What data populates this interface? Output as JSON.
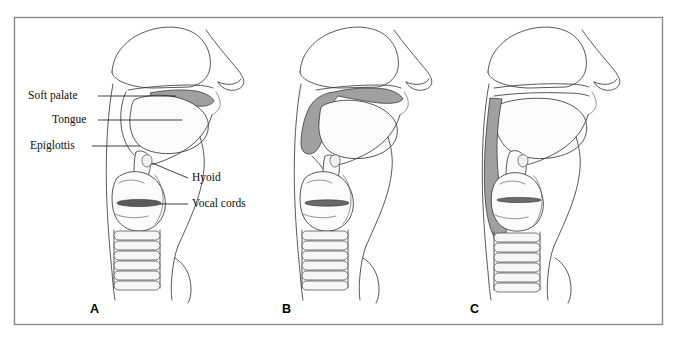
{
  "figure": {
    "frame": {
      "x": 14,
      "y": 17,
      "width": 649,
      "height": 308,
      "border_color": "#8a8a8a"
    },
    "background_color": "#ffffff",
    "line_color": "#3a3a3a",
    "shade_color": "#a0a0a0",
    "cords_color": "#5a5a5a"
  },
  "labels": [
    {
      "id": "soft-palate",
      "text": "Soft palate",
      "x": 28,
      "y": 90,
      "align": "left"
    },
    {
      "id": "tongue",
      "text": "Tongue",
      "x": 52,
      "y": 114,
      "align": "left"
    },
    {
      "id": "epiglottis",
      "text": "Epiglottis",
      "x": 30,
      "y": 140,
      "align": "left"
    },
    {
      "id": "hyoid",
      "text": "Hyoid",
      "x": 192,
      "y": 175,
      "align": "left"
    },
    {
      "id": "vocal-cords",
      "text": "Vocal cords",
      "x": 192,
      "y": 200,
      "align": "left"
    }
  ],
  "panels": [
    {
      "id": "a",
      "letter": "A",
      "x": 90,
      "y": 303,
      "shading": "soft palate elevated against pharyngeal wall"
    },
    {
      "id": "b",
      "letter": "B",
      "x": 282,
      "y": 303,
      "shading": "soft palate and anterior pharyngeal wall shaded"
    },
    {
      "id": "c",
      "letter": "C",
      "x": 470,
      "y": 303,
      "shading": "posterior pharyngeal wall shaded"
    }
  ]
}
